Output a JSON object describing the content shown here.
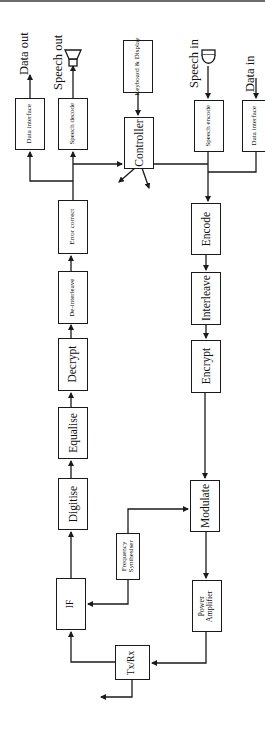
{
  "diagram": {
    "type": "block-diagram",
    "orientation": "rotated-90-ccw",
    "receive_chain": {
      "blocks": [
        {
          "id": "if",
          "label": "IF"
        },
        {
          "id": "digitise",
          "label": "Digitise"
        },
        {
          "id": "equalise",
          "label": "Equalise"
        },
        {
          "id": "decrypt",
          "label": "Decrypt"
        },
        {
          "id": "deinterleave",
          "label": "De-interleave"
        },
        {
          "id": "error_correct",
          "label": "Error correct"
        },
        {
          "id": "speech_decode",
          "label": "Speech decode"
        },
        {
          "id": "data_interface_out",
          "label": "Data interface"
        }
      ],
      "outputs": {
        "speech": "Speech out",
        "data": "Data out"
      }
    },
    "transmit_chain": {
      "blocks": [
        {
          "id": "speech_encode",
          "label": "Speech encode"
        },
        {
          "id": "data_interface_in",
          "label": "Data interface"
        },
        {
          "id": "encode",
          "label": "Encode"
        },
        {
          "id": "interleave",
          "label": "Interleave"
        },
        {
          "id": "encrypt",
          "label": "Encrypt"
        },
        {
          "id": "modulate",
          "label": "Modulate"
        },
        {
          "id": "power_amplifier",
          "label_line1": "Power",
          "label_line2": "Amplifier"
        }
      ],
      "inputs": {
        "speech": "Speech in",
        "data": "Data in"
      }
    },
    "shared": {
      "controller": "Controller",
      "keyboard_display": "Keyboard & Display",
      "freq_synth_line1": "Frequency",
      "freq_synth_line2": "Synthesiser",
      "txrx": "Tx/Rx"
    }
  }
}
